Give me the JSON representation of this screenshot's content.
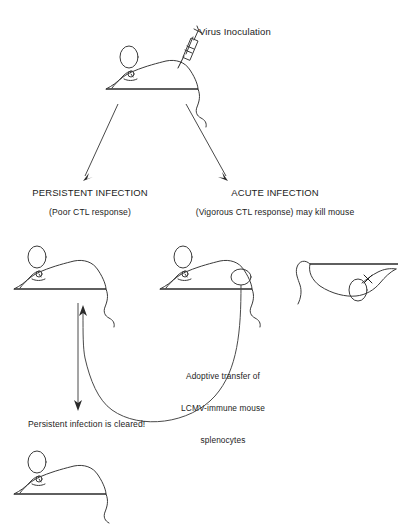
{
  "figure": {
    "background_color": "#ffffff",
    "ink_color": "#3a3a3a"
  },
  "labels": {
    "virus_inoculation": "Virus Inoculation",
    "persistent_title": "PERSISTENT INFECTION",
    "persistent_sub": "(Poor CTL response)",
    "acute_title": "ACUTE INFECTION",
    "acute_sub": "(Vigorous CTL response) may kill mouse",
    "adoptive_line1": "Adoptive transfer of",
    "adoptive_line2": "LCMV-immune mouse",
    "adoptive_line3": "splenocytes",
    "cleared": "Persistent infection is cleared!"
  },
  "icons": {
    "syringe": "syringe-icon",
    "mouse_top": "mouse-inoculated-icon",
    "mouse_persistent": "mouse-persistent-icon",
    "mouse_donor": "mouse-donor-spleen-icon",
    "mouse_dead": "mouse-dead-icon",
    "mouse_cleared": "mouse-cleared-icon",
    "arrow_left": "arrow-to-persistent-icon",
    "arrow_right": "arrow-to-acute-icon",
    "arrow_down": "arrow-down-outcome-icon",
    "arrow_transfer": "arrow-adoptive-transfer-icon",
    "dead_eye": "x-eye-icon",
    "spleen": "spleen-circle-icon"
  }
}
